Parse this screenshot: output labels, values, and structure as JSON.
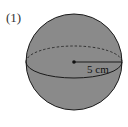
{
  "problem": {
    "number_label": "(1)",
    "shape": "sphere",
    "radius_label": "5 cm",
    "fill_color": "#8a8a8a",
    "stroke_color": "#1a1a1a"
  }
}
